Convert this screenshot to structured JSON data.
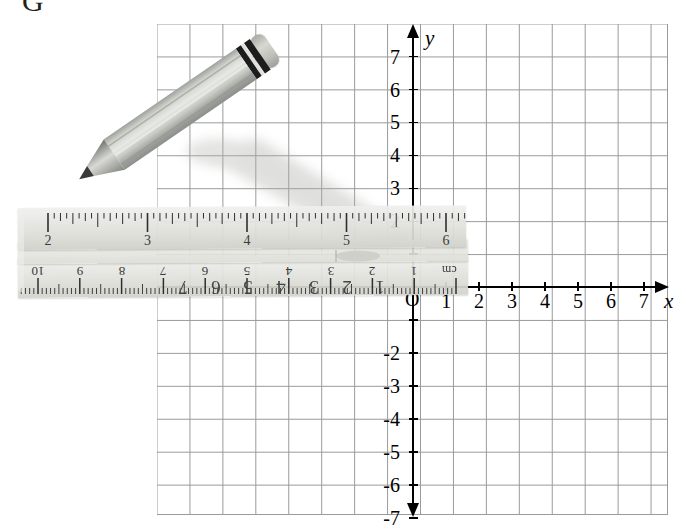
{
  "figure": {
    "clipped_heading": "G"
  },
  "axes": {
    "x_label": "x",
    "y_label": "y",
    "origin_label": "O",
    "x_ticks_positive": [
      "1",
      "2",
      "3",
      "4",
      "5",
      "6",
      "7"
    ],
    "x_ticks_negative": [
      "-1",
      "-2",
      "-3",
      "-4",
      "-5",
      "-6",
      "-7"
    ],
    "y_ticks_positive": [
      "1",
      "2",
      "3",
      "4",
      "5",
      "6",
      "7"
    ],
    "y_ticks_negative": [
      "-2",
      "-3",
      "-4",
      "-5",
      "-6",
      "-7"
    ],
    "grid_color": "#9a9a9a",
    "axis_color": "#000000"
  },
  "ruler": {
    "inch_scale_labels": [
      "2",
      "3",
      "4",
      "5",
      "6"
    ],
    "cm_scale_labels": [
      "10",
      "9",
      "8",
      "7",
      "6",
      "5",
      "4",
      "3",
      "2",
      "1"
    ],
    "cm_unit_label": "cm",
    "body_color": "#e2e2dd"
  },
  "pencil": {
    "body_color": "#b9bcb6",
    "ferrule_color": "#1a1a1a",
    "eraser_color": "#c9c9c4",
    "tip_color": "#4a4a4a",
    "orientation": "diagonal from upper-left to lower-right",
    "tip_point": "near (5, 2)"
  },
  "chart_data": {
    "type": "scatter",
    "title": "",
    "xlabel": "x",
    "ylabel": "y",
    "xlim": [
      -7.75,
      7.75
    ],
    "ylim": [
      -7.9,
      7.9
    ],
    "grid": true,
    "x": [],
    "y": []
  }
}
